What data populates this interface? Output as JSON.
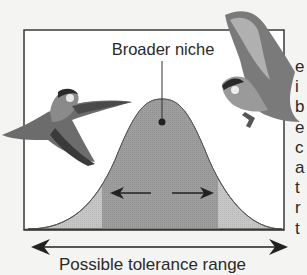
{
  "figure": {
    "niche_label": "Broader niche",
    "axis_label": "Possible tolerance range",
    "colors": {
      "background": "#f4f4f2",
      "box_stroke": "#3a3a3a",
      "curve_fill_outer": "#c6c6c6",
      "curve_fill_inner": "#9c9c9c",
      "arrow": "#222222"
    },
    "illustrations": [
      "bird-left",
      "bird-right"
    ],
    "cropped_side_text": [
      "e",
      "i",
      "b",
      "e",
      "c",
      "a",
      "t",
      "r",
      "t"
    ]
  }
}
